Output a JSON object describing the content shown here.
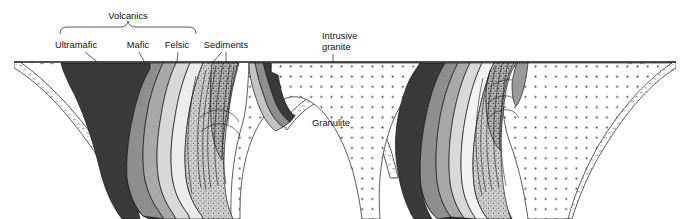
{
  "figure": {
    "kind": "geologic-cross-section",
    "caption_labels": {
      "volcanics": "Volcanics",
      "ultramafic": "Ultramafic",
      "mafic": "Mafic",
      "felsic": "Felsic",
      "sediments": "Sediments",
      "intrusive_granite_line1": "Intrusive",
      "intrusive_granite_line2": "granite",
      "granulite": "Granulite"
    },
    "colors": {
      "background": "#ffffff",
      "ink": "#1a1a1a",
      "ultramafic": "#3a3a3a",
      "mafic_dark": "#8e8e8e",
      "mafic_mid": "#a8a8a8",
      "felsic_light": "#d8d8d8",
      "felsic_pale": "#ececec",
      "sediments_stipple_base": "#c9c9c9",
      "granite_fill": "#ffffff",
      "granite_dot": "#333333",
      "granulite_fill": "#ffffff",
      "granulite_edge": "#444444"
    },
    "units": [
      {
        "name": "Ultramafic",
        "tone": "very-dark-grey",
        "pattern": "solid"
      },
      {
        "name": "Mafic",
        "tone": "medium-grey",
        "pattern": "solid"
      },
      {
        "name": "Felsic",
        "tone": "light-grey",
        "pattern": "solid"
      },
      {
        "name": "Sediments",
        "tone": "grey",
        "pattern": "stippled-with-contours"
      },
      {
        "name": "Intrusive granite",
        "tone": "white",
        "pattern": "square-dots"
      },
      {
        "name": "Granulite",
        "tone": "white",
        "pattern": "hooked-dashes"
      }
    ],
    "structures": [
      {
        "name": "left synform",
        "description": "deep keel-shaped basin of layered volcanics and sediments"
      },
      {
        "name": "central remnant",
        "description": "small narrow keel of layered rocks between basins"
      },
      {
        "name": "right synform",
        "description": "deep basin of layered volcanics and sediments"
      }
    ]
  }
}
